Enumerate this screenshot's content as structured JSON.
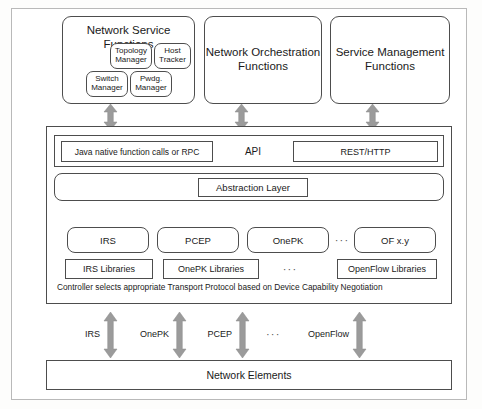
{
  "figure": {
    "colors": {
      "arrow_gray": "#9b9b9b",
      "border_dark": "#4d4d4d",
      "frame_light": "#b9b9b9",
      "background": "#ffffff"
    }
  },
  "top_blocks": {
    "network_service_functions": {
      "title": "Network Service Functions",
      "sub_boxes": [
        {
          "label": "Topology Manager"
        },
        {
          "label": "Host Tracker"
        },
        {
          "label": "Switch Manager"
        },
        {
          "label": "Pwdg. Manager"
        }
      ]
    },
    "network_orchestration_functions": {
      "title": "Network Orchestration Functions"
    },
    "service_management_functions": {
      "title": "Service Management Functions"
    }
  },
  "controller": {
    "api_row": {
      "left_label": "Java native function calls or RPC",
      "center_label": "API",
      "right_label": "REST/HTTP"
    },
    "abstraction_layer": {
      "label": "Abstraction Layer"
    },
    "protocols": [
      {
        "label": "IRS"
      },
      {
        "label": "PCEP"
      },
      {
        "label": "OnePK"
      },
      {
        "label": "OF x.y"
      }
    ],
    "protocols_ellipsis": "···",
    "libraries": [
      {
        "label": "IRS Libraries"
      },
      {
        "label": "OnePK Libraries"
      },
      {
        "label": "OpenFlow Libraries"
      }
    ],
    "libraries_ellipsis": "···",
    "caption": "Controller selects appropriate Transport Protocol based on Device Capability Negotiation"
  },
  "southbound": {
    "labels": [
      {
        "label": "IRS"
      },
      {
        "label": "OnePK"
      },
      {
        "label": "PCEP"
      },
      {
        "label": "OpenFlow"
      }
    ],
    "ellipsis": "···"
  },
  "network_elements": {
    "label": "Network Elements"
  }
}
